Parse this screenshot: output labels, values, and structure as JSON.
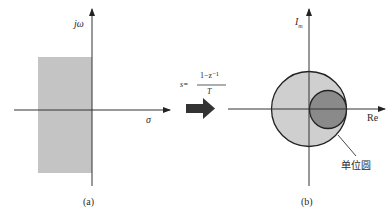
{
  "panel_a": {
    "y_axis_label": "jω",
    "x_axis_label": "σ",
    "caption": "(a)",
    "region_color": "#c4c4c4",
    "region_description": "left half-plane strip (stable region)"
  },
  "mapping": {
    "formula_lhs": "s=",
    "formula_numerator": "1−z⁻¹",
    "formula_denominator": "T",
    "arrow": "right-arrow-icon",
    "arrow_color": "#333333"
  },
  "panel_b": {
    "y_axis_label_main": "I",
    "y_axis_label_sub": "m",
    "x_axis_label": "Re",
    "unit_circle_label": "单位圆",
    "caption": "(b)",
    "unit_circle_fill": "#cfcfcf",
    "mapped_circle_fill": "#8a8a8a"
  }
}
